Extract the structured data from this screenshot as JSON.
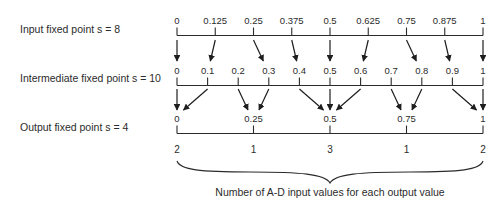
{
  "labels": {
    "input": "Input fixed point s = 8",
    "intermediate": "Intermediate fixed point s = 10",
    "output": "Output fixed point s = 4"
  },
  "caption": "Number of A-D input values for each output value",
  "scales": [
    {
      "id": "input",
      "s": 8,
      "ticks": [
        0,
        0.125,
        0.25,
        0.375,
        0.5,
        0.625,
        0.75,
        0.875,
        1
      ],
      "tick_labels": [
        "0",
        "0.125",
        "0.25",
        "0.375",
        "0.5",
        "0.625",
        "0.75",
        "0.875",
        "1"
      ]
    },
    {
      "id": "intermediate",
      "s": 10,
      "ticks": [
        0,
        0.1,
        0.2,
        0.3,
        0.4,
        0.5,
        0.6,
        0.7,
        0.8,
        0.9,
        1
      ],
      "tick_labels": [
        "0",
        "0.1",
        "0.2",
        "0.3",
        "0.4",
        "0.5",
        "0.6",
        "0.7",
        "0.8",
        "0.9",
        "1"
      ]
    },
    {
      "id": "output",
      "s": 4,
      "ticks": [
        0,
        0.25,
        0.5,
        0.75,
        1
      ],
      "tick_labels": [
        "0",
        "0.25",
        "0.5",
        "0.75",
        "1"
      ]
    }
  ],
  "mappings": {
    "input_to_intermediate": [
      [
        0,
        0
      ],
      [
        0.125,
        0.1
      ],
      [
        0.25,
        0.3
      ],
      [
        0.375,
        0.4
      ],
      [
        0.5,
        0.5
      ],
      [
        0.625,
        0.6
      ],
      [
        0.75,
        0.8
      ],
      [
        0.875,
        0.9
      ],
      [
        1,
        1
      ]
    ],
    "intermediate_to_output": [
      [
        0,
        0
      ],
      [
        0.1,
        0
      ],
      [
        0.2,
        0.25
      ],
      [
        0.3,
        0.25
      ],
      [
        0.4,
        0.5
      ],
      [
        0.5,
        0.5
      ],
      [
        0.6,
        0.5
      ],
      [
        0.7,
        0.75
      ],
      [
        0.8,
        0.75
      ],
      [
        0.9,
        1
      ],
      [
        1,
        1
      ]
    ]
  },
  "counts": {
    "positions": [
      0,
      0.25,
      0.5,
      0.75,
      1
    ],
    "values": [
      "2",
      "1",
      "3",
      "1",
      "2"
    ]
  }
}
